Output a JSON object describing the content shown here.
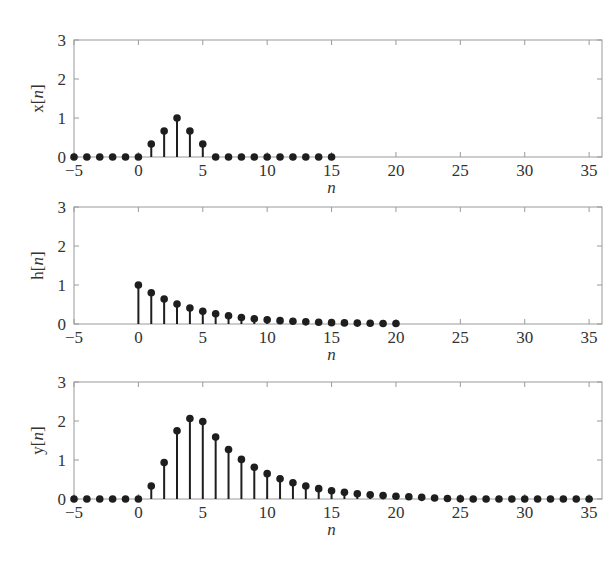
{
  "chart_data": [
    {
      "type": "stem",
      "title": "",
      "xlabel": "n",
      "ylabel": "x[n]",
      "xlim": [
        -5,
        36
      ],
      "ylim": [
        0,
        3
      ],
      "xticks": [
        -5,
        0,
        5,
        10,
        15,
        20,
        25,
        30,
        35
      ],
      "yticks": [
        0,
        1,
        2,
        3
      ],
      "grid": false,
      "x": [
        -5,
        -4,
        -3,
        -2,
        -1,
        0,
        1,
        2,
        3,
        4,
        5,
        6,
        7,
        8,
        9,
        10,
        11,
        12,
        13,
        14,
        15
      ],
      "values": [
        0,
        0,
        0,
        0,
        0,
        0,
        0.333,
        0.667,
        1,
        0.667,
        0.333,
        0,
        0,
        0,
        0,
        0,
        0,
        0,
        0,
        0,
        0
      ]
    },
    {
      "type": "stem",
      "title": "",
      "xlabel": "n",
      "ylabel": "h[n]",
      "xlim": [
        -5,
        36
      ],
      "ylim": [
        0,
        3
      ],
      "xticks": [
        -5,
        0,
        5,
        10,
        15,
        20,
        25,
        30,
        35
      ],
      "yticks": [
        0,
        1,
        2,
        3
      ],
      "grid": false,
      "x": [
        0,
        1,
        2,
        3,
        4,
        5,
        6,
        7,
        8,
        9,
        10,
        11,
        12,
        13,
        14,
        15,
        16,
        17,
        18,
        19,
        20
      ],
      "values": [
        1,
        0.8,
        0.64,
        0.512,
        0.41,
        0.328,
        0.262,
        0.21,
        0.168,
        0.134,
        0.107,
        0.086,
        0.069,
        0.055,
        0.044,
        0.035,
        0.028,
        0.023,
        0.018,
        0.014,
        0.012
      ]
    },
    {
      "type": "stem",
      "title": "",
      "xlabel": "n",
      "ylabel": "y[n]",
      "xlim": [
        -5,
        36
      ],
      "ylim": [
        0,
        3
      ],
      "xticks": [
        -5,
        0,
        5,
        10,
        15,
        20,
        25,
        30,
        35
      ],
      "yticks": [
        0,
        1,
        2,
        3
      ],
      "grid": false,
      "x": [
        -5,
        -4,
        -3,
        -2,
        -1,
        0,
        1,
        2,
        3,
        4,
        5,
        6,
        7,
        8,
        9,
        10,
        11,
        12,
        13,
        14,
        15,
        16,
        17,
        18,
        19,
        20,
        21,
        22,
        23,
        24,
        25,
        26,
        27,
        28,
        29,
        30,
        31,
        32,
        33,
        34,
        35
      ],
      "values": [
        0,
        0,
        0,
        0,
        0,
        0,
        0.333,
        0.933,
        1.747,
        2.064,
        1.984,
        1.587,
        1.27,
        1.016,
        0.813,
        0.65,
        0.52,
        0.416,
        0.333,
        0.266,
        0.213,
        0.17,
        0.136,
        0.109,
        0.087,
        0.07,
        0.056,
        0.042,
        0.027,
        0.013,
        0.004,
        0,
        0,
        0,
        0,
        0,
        0,
        0,
        0,
        0,
        0
      ]
    }
  ],
  "subplots": [
    {
      "ylabel_main": "x",
      "ylabel_var": "n",
      "xlabel": "n"
    },
    {
      "ylabel_main": "h",
      "ylabel_var": "n",
      "xlabel": "n"
    },
    {
      "ylabel_main": "y",
      "ylabel_var": "n",
      "xlabel": "n"
    }
  ],
  "colors": {
    "stem": "#1e1e1e",
    "frame": "#9a9a9a",
    "text": "#333333"
  }
}
